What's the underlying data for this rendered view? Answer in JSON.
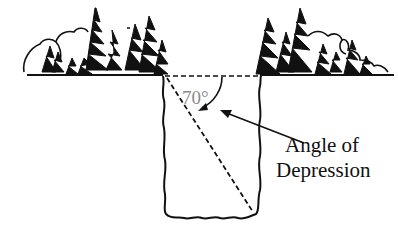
{
  "diagram": {
    "angle_value": "70°",
    "label_line1": "Angle of",
    "label_line2": "Depression",
    "colors": {
      "ink": "#111111",
      "angle_label": "#8a8a8a",
      "background": "#ffffff"
    }
  }
}
